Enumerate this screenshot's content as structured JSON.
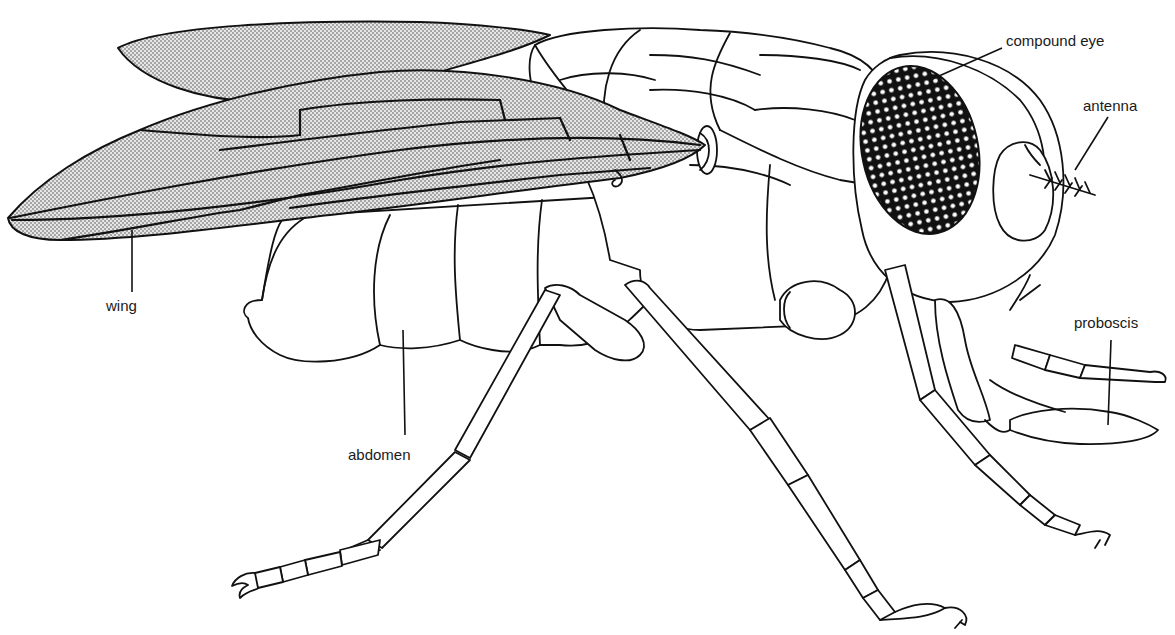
{
  "figure": {
    "colors": {
      "background": "#ffffff",
      "line": "#111111",
      "wing_stipple": "#b8b8b8",
      "eye_fill": "#111111"
    },
    "labels": [
      {
        "id": "compound_eye",
        "text": "compound eye"
      },
      {
        "id": "antenna",
        "text": "antenna"
      },
      {
        "id": "wing",
        "text": "wing"
      },
      {
        "id": "abdomen",
        "text": "abdomen"
      },
      {
        "id": "proboscis",
        "text": "proboscis"
      }
    ]
  }
}
